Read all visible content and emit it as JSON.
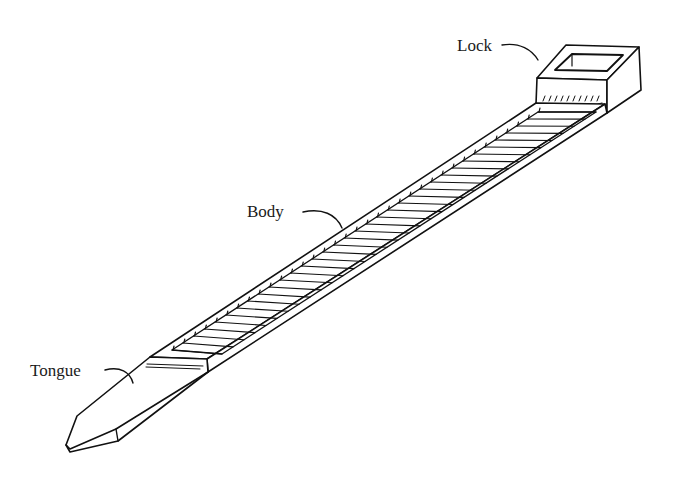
{
  "diagram": {
    "labels": {
      "lock": "Lock",
      "body": "Body",
      "tongue": "Tongue"
    },
    "colors": {
      "line": "#111111",
      "background": "#ffffff"
    }
  }
}
